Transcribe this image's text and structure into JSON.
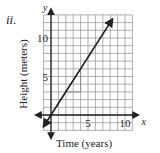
{
  "problem_label": "ii.",
  "chart_data": {
    "type": "line",
    "title": "",
    "xlabel": "Time (years)",
    "ylabel": "Height (meters)",
    "x_axis_var": "x",
    "y_axis_var": "y",
    "xlim": [
      -1,
      11
    ],
    "ylim": [
      -2,
      13
    ],
    "x_ticks": [
      5,
      10
    ],
    "y_ticks": [
      5,
      10
    ],
    "x_tick_labels": [
      "5",
      "10"
    ],
    "y_tick_labels": [
      "5",
      "10"
    ],
    "grid": true,
    "grid_step": 1,
    "series": [
      {
        "name": "line",
        "equation": "y = 1.5x",
        "slope": 1.5,
        "intercept": 0,
        "x": [
          -1,
          0,
          2,
          4,
          8.3
        ],
        "y": [
          -1.5,
          0,
          3,
          6,
          12.5
        ],
        "arrows_both_ends": true
      }
    ],
    "annotations": [
      {
        "type": "slope-triangle",
        "from": [
          2,
          3
        ],
        "to": [
          4,
          6
        ],
        "run": 2,
        "rise": 3
      }
    ]
  }
}
